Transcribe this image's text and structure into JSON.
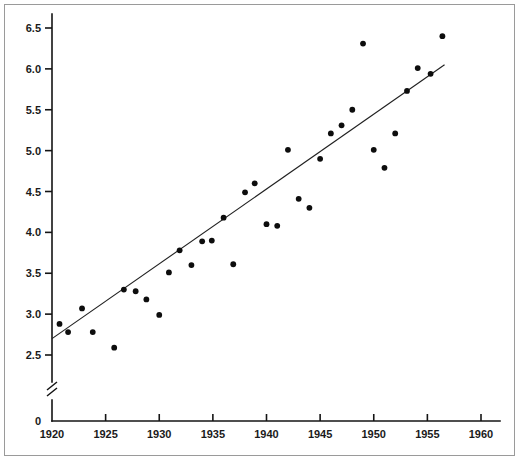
{
  "chart_data": {
    "type": "scatter",
    "title": "",
    "subtitle": "",
    "xlabel": "",
    "ylabel": "",
    "xlim": [
      1920,
      1960
    ],
    "ylim": [
      2.5,
      6.5
    ],
    "y_axis_break": true,
    "y_axis_break_label": "0",
    "grid": false,
    "legend": null,
    "xticks": [
      1920,
      1925,
      1930,
      1935,
      1940,
      1945,
      1950,
      1955,
      1960
    ],
    "xtick_labels": [
      "1920",
      "1925",
      "1930",
      "1935",
      "1940",
      "1945",
      "1950",
      "1955",
      "1960"
    ],
    "yticks": [
      2.5,
      3.0,
      3.5,
      4.0,
      4.5,
      5.0,
      5.5,
      6.0,
      6.5
    ],
    "ytick_labels": [
      "2.5",
      "3.0",
      "3.5",
      "4.0",
      "4.5",
      "5.0",
      "5.5",
      "6.0",
      "6.5"
    ],
    "marker": "filled-circle",
    "marker_color": "#0d0d0d",
    "line_color": "#202020",
    "series": [
      {
        "name": "observations",
        "x": [
          1920.7,
          1921.5,
          1922.8,
          1923.8,
          1925.8,
          1926.7,
          1927.8,
          1928.8,
          1930.0,
          1930.9,
          1931.9,
          1933.0,
          1934.0,
          1934.9,
          1936.0,
          1936.9,
          1938.0,
          1938.9,
          1940.0,
          1941.0,
          1942.0,
          1943.0,
          1944.0,
          1945.0,
          1946.0,
          1947.0,
          1948.0,
          1949.0,
          1950.0,
          1951.0,
          1952.0,
          1953.1,
          1954.1,
          1955.3,
          1956.4
        ],
        "y": [
          2.88,
          2.78,
          3.07,
          2.78,
          2.59,
          3.3,
          3.28,
          3.18,
          2.99,
          3.51,
          3.78,
          3.6,
          3.89,
          3.9,
          4.18,
          3.61,
          4.49,
          4.6,
          4.1,
          4.08,
          5.01,
          4.41,
          4.3,
          4.9,
          5.21,
          5.31,
          5.5,
          6.31,
          5.01,
          4.79,
          5.21,
          5.73,
          6.01,
          5.94,
          6.4
        ]
      }
    ],
    "fit_line": {
      "name": "least-squares-fit",
      "x": [
        1920.0,
        1956.6
      ],
      "y": [
        2.7,
        6.05
      ]
    }
  }
}
